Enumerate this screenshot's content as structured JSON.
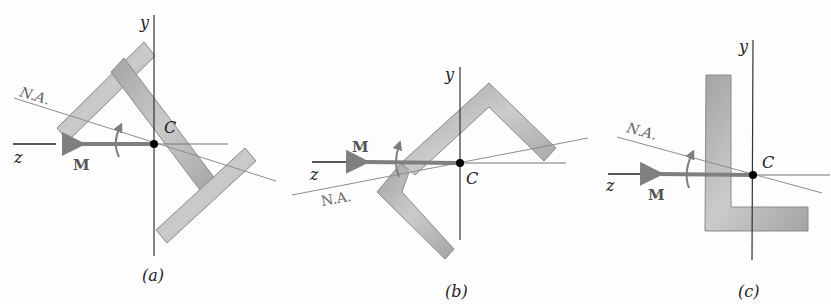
{
  "figure": {
    "panels": [
      {
        "id": "a",
        "caption": "(a)",
        "section_shape": "Z-section rotated",
        "labels": {
          "y_axis": "y",
          "z_axis": "z",
          "centroid": "C",
          "moment": "M",
          "neutral_axis": "N.A."
        }
      },
      {
        "id": "b",
        "caption": "(b)",
        "section_shape": "zigzag angle section",
        "labels": {
          "y_axis": "y",
          "z_axis": "z",
          "centroid": "C",
          "moment": "M",
          "neutral_axis": "N.A."
        }
      },
      {
        "id": "c",
        "caption": "(c)",
        "section_shape": "L-section (angle)",
        "labels": {
          "y_axis": "y",
          "z_axis": "z",
          "centroid": "C",
          "moment": "M",
          "neutral_axis": "N.A."
        }
      }
    ],
    "colors": {
      "section_fill": "#a9a9a9",
      "section_fill_light": "#cfcfcf",
      "section_stroke": "#8a8a8a",
      "moment_arrow": "#7f7f7f",
      "axis": "#333333",
      "neutral_axis": "#8c8c8c",
      "centroid_dot": "#000000"
    }
  }
}
